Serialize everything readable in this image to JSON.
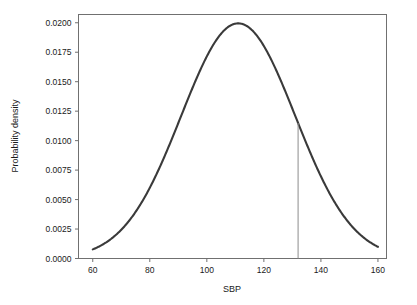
{
  "chart_data": {
    "type": "line",
    "title": "",
    "xlabel": "SBP",
    "ylabel": "Probability density",
    "xlim": [
      55,
      163
    ],
    "ylim": [
      0.0,
      0.0207
    ],
    "grid": false,
    "legend": null,
    "xticks": [
      60,
      80,
      100,
      120,
      140,
      160
    ],
    "xtick_labels": [
      "60",
      "80",
      "100",
      "120",
      "140",
      "160"
    ],
    "yticks": [
      0.0,
      0.0025,
      0.005,
      0.0075,
      0.01,
      0.0125,
      0.015,
      0.0175,
      0.02
    ],
    "ytick_labels": [
      "0.0000",
      "0.0025",
      "0.0050",
      "0.0075",
      "0.0100",
      "0.0125",
      "0.0150",
      "0.0175",
      "0.0200"
    ],
    "series": [
      {
        "name": "normal-density",
        "kind": "line",
        "color": "#3a3a3a",
        "line_width": 2.1,
        "distribution": "normal",
        "mean": 111,
        "sd": 20,
        "peak_density": 0.02,
        "x_start": 60,
        "x_end": 160,
        "x": [
          60,
          64,
          68,
          72,
          76,
          80,
          84,
          88,
          92,
          96,
          100,
          104,
          108,
          111,
          114,
          118,
          122,
          126,
          130,
          134,
          138,
          142,
          146,
          150,
          154,
          158,
          160
        ],
        "values": [
          0.00082,
          0.00124,
          0.00181,
          0.00257,
          0.00354,
          0.00473,
          0.00613,
          0.00771,
          0.00939,
          0.01109,
          0.01269,
          0.01409,
          0.01515,
          0.01995,
          0.0197,
          0.0189,
          0.0175,
          0.0156,
          0.0134,
          0.0111,
          0.00889,
          0.00687,
          0.00514,
          0.00372,
          0.0026,
          0.00176,
          0.00092
        ]
      }
    ],
    "annotations": [
      {
        "name": "threshold-line",
        "kind": "vertical-line",
        "x": 132,
        "y_from": 0.0,
        "y_to": 0.0121,
        "color": "#8c8c8c",
        "line_width": 1
      }
    ]
  },
  "axis": {
    "x_title": "SBP",
    "y_title": "Probability density",
    "x_tick_labels": [
      "60",
      "80",
      "100",
      "120",
      "140",
      "160"
    ],
    "y_tick_labels": [
      "0.0000",
      "0.0025",
      "0.0050",
      "0.0075",
      "0.0100",
      "0.0125",
      "0.0150",
      "0.0175",
      "0.0200"
    ]
  },
  "style": {
    "frame_color": "#707070",
    "curve_color": "#3a3a3a",
    "marker_color": "#8c8c8c",
    "background": "#ffffff",
    "text_color": "#1a1a1a"
  }
}
